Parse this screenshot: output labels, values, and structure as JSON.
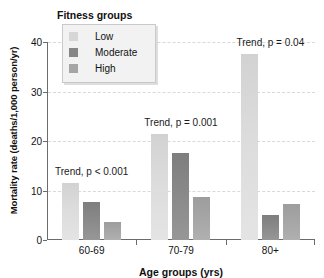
{
  "chart_data": {
    "type": "bar",
    "title": "",
    "xlabel": "Age groups (yrs)",
    "ylabel": "Mortality rate (deaths/1,000 person/yr)",
    "categories": [
      "60-69",
      "70-79",
      "80+"
    ],
    "series": [
      {
        "name": "Low",
        "color": "#dcdcdc",
        "values": [
          11.5,
          21.5,
          37.5
        ]
      },
      {
        "name": "Moderate",
        "color": "#8a8a8a",
        "values": [
          7.7,
          17.5,
          5.0
        ]
      },
      {
        "name": "High",
        "color": "#a6a6a6",
        "values": [
          3.7,
          8.6,
          7.2
        ]
      }
    ],
    "ylim": [
      0,
      40
    ],
    "yticks": [
      0,
      10,
      20,
      30,
      40
    ],
    "grid": "horizontal-dashed",
    "legend": {
      "title": "Fitness groups",
      "position": "top-left-inside",
      "entries": [
        "Low",
        "Moderate",
        "High"
      ]
    },
    "annotations": [
      {
        "text": "Trend, p < 0.001",
        "group": "60-69"
      },
      {
        "text": "Trend, p = 0.001",
        "group": "70-79"
      },
      {
        "text": "Trend, p = 0.04",
        "group": "80+"
      }
    ]
  }
}
